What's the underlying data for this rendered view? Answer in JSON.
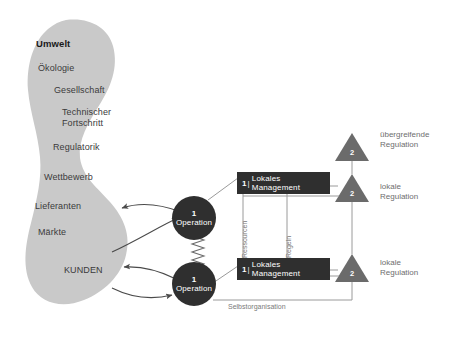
{
  "diagram": {
    "title_hidden": "Viable System Model Diagram",
    "colors": {
      "environment_blob": "#c9c9c9",
      "node_dark": "#2f2f2f",
      "triangle": "#6b6b6b",
      "connector": "#9a9a9a",
      "arrow": "#4a4a4a",
      "label_gray": "#6e6e6e",
      "background": "#ffffff"
    },
    "environment": {
      "title": "Umwelt",
      "items": [
        {
          "label": "Ökologie"
        },
        {
          "label": "Gesellschaft"
        },
        {
          "label": "Technischer"
        },
        {
          "label": "Fortschritt"
        },
        {
          "label": "Regulatorik"
        },
        {
          "label": "Wettbewerb"
        },
        {
          "label": "Lieferanten"
        },
        {
          "label": "Märkte"
        },
        {
          "label": "KUNDEN"
        }
      ]
    },
    "operations": [
      {
        "number": "1",
        "separator": "|",
        "label": "Operation"
      },
      {
        "number": "1",
        "separator": "|",
        "label": "Operation"
      }
    ],
    "management": [
      {
        "number": "1",
        "separator": "|",
        "label": "Lokales Management"
      },
      {
        "number": "1",
        "separator": "|",
        "label": "Lokales Management"
      }
    ],
    "regulators": [
      {
        "number": "2",
        "label_line1": "übergreifende",
        "label_line2": "Regulation"
      },
      {
        "number": "2",
        "label_line1": "lokale",
        "label_line2": "Regulation"
      },
      {
        "number": "2",
        "label_line1": "lokale",
        "label_line2": "Regulation"
      }
    ],
    "flows": {
      "resources": "Ressourcen",
      "rules": "Regeln",
      "self_organization": "Selbstorganisation"
    }
  }
}
